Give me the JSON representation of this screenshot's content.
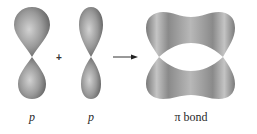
{
  "diagram": {
    "type": "orbital-combination",
    "operator_plus": "+",
    "arrow": "reaction-arrow",
    "labels": {
      "orbital1": "p",
      "orbital2": "p",
      "result": "π bond"
    },
    "colors": {
      "lobe_fill": "#8f8f8f",
      "lobe_highlight": "#cfcfcf",
      "lobe_shadow": "#5e5e5e",
      "text": "#2a2a2a"
    }
  }
}
